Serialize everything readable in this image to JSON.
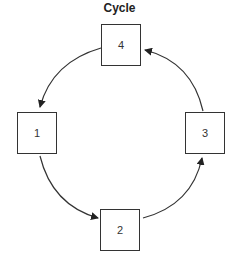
{
  "diagram": {
    "title": "Cycle",
    "nodes": [
      {
        "id": "n1",
        "label": "1"
      },
      {
        "id": "n2",
        "label": "2"
      },
      {
        "id": "n3",
        "label": "3"
      },
      {
        "id": "n4",
        "label": "4"
      }
    ],
    "edges": [
      {
        "from": "4",
        "to": "1"
      },
      {
        "from": "1",
        "to": "2"
      },
      {
        "from": "2",
        "to": "3"
      },
      {
        "from": "3",
        "to": "4"
      }
    ],
    "colors": {
      "stroke": "#333333",
      "background": "#ffffff"
    }
  }
}
